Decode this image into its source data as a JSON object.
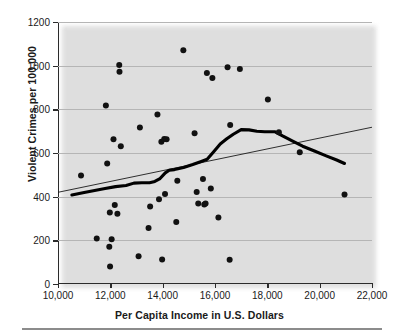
{
  "chart_data": {
    "type": "scatter",
    "title": "",
    "xlabel": "Per Capita Income in U.S. Dollars",
    "ylabel": "Violent Crimes per 100,000",
    "xlim": [
      10000,
      22000
    ],
    "ylim": [
      0,
      1200
    ],
    "xticks": [
      10000,
      12000,
      14000,
      16000,
      18000,
      20000,
      22000
    ],
    "xtick_labels": [
      "10,000",
      "12,000",
      "14,000",
      "16,000",
      "18,000",
      "20,000",
      "22,000"
    ],
    "yticks": [
      0,
      200,
      400,
      600,
      800,
      1000,
      1200
    ],
    "ytick_labels": [
      "0",
      "200",
      "400",
      "600",
      "800",
      "1000",
      "1200"
    ],
    "grid": "horizontal",
    "legend": "none",
    "series": [
      {
        "name": "States",
        "type": "scatter",
        "marker": "filled-circle",
        "color": "#111111",
        "points": [
          [
            10880,
            497
          ],
          [
            11480,
            208
          ],
          [
            11830,
            818
          ],
          [
            11880,
            552
          ],
          [
            11960,
            171
          ],
          [
            11980,
            328
          ],
          [
            11990,
            80
          ],
          [
            12050,
            205
          ],
          [
            12120,
            663
          ],
          [
            12170,
            362
          ],
          [
            12270,
            322
          ],
          [
            12340,
            1003
          ],
          [
            12350,
            972
          ],
          [
            12400,
            631
          ],
          [
            13080,
            127
          ],
          [
            13130,
            717
          ],
          [
            13460,
            256
          ],
          [
            13520,
            355
          ],
          [
            13800,
            776
          ],
          [
            13860,
            388
          ],
          [
            13950,
            651
          ],
          [
            13980,
            112
          ],
          [
            14060,
            664
          ],
          [
            14090,
            412
          ],
          [
            14150,
            663
          ],
          [
            14520,
            284
          ],
          [
            14560,
            473
          ],
          [
            14790,
            1071
          ],
          [
            15220,
            690
          ],
          [
            15300,
            421
          ],
          [
            15360,
            369
          ],
          [
            15540,
            481
          ],
          [
            15590,
            364
          ],
          [
            15640,
            369
          ],
          [
            15690,
            966
          ],
          [
            15840,
            437
          ],
          [
            15900,
            944
          ],
          [
            16130,
            305
          ],
          [
            16480,
            993
          ],
          [
            16560,
            111
          ],
          [
            16580,
            728
          ],
          [
            16950,
            985
          ],
          [
            18020,
            845
          ],
          [
            18440,
            695
          ],
          [
            19240,
            604
          ],
          [
            20950,
            410
          ]
        ]
      },
      {
        "name": "Least-squares regression line",
        "type": "line",
        "color": "#1a1a1a",
        "points": [
          [
            10000,
            420
          ],
          [
            22000,
            718
          ]
        ]
      },
      {
        "name": "Smoothed trend curve",
        "type": "line",
        "color": "#000000",
        "points": [
          [
            10530,
            408
          ],
          [
            11000,
            419
          ],
          [
            11400,
            428
          ],
          [
            11800,
            437
          ],
          [
            12200,
            446
          ],
          [
            12600,
            451
          ],
          [
            12900,
            462
          ],
          [
            13200,
            464
          ],
          [
            13500,
            464
          ],
          [
            13700,
            470
          ],
          [
            13900,
            483
          ],
          [
            14100,
            509
          ],
          [
            14250,
            521
          ],
          [
            14450,
            524
          ],
          [
            14800,
            534
          ],
          [
            15150,
            547
          ],
          [
            15450,
            560
          ],
          [
            15700,
            571
          ],
          [
            15950,
            606
          ],
          [
            16200,
            641
          ],
          [
            16450,
            665
          ],
          [
            16700,
            686
          ],
          [
            17000,
            707
          ],
          [
            17300,
            706
          ],
          [
            17600,
            700
          ],
          [
            17900,
            697
          ],
          [
            18300,
            697
          ],
          [
            18600,
            677
          ],
          [
            18950,
            655
          ],
          [
            19350,
            631
          ],
          [
            19800,
            609
          ],
          [
            20250,
            587
          ],
          [
            20650,
            568
          ],
          [
            20950,
            552
          ]
        ]
      }
    ]
  }
}
